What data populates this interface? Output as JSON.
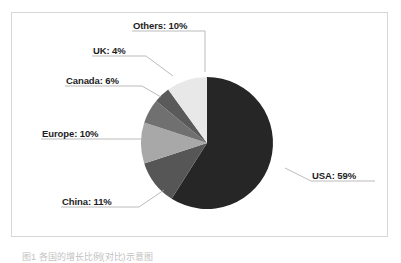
{
  "figure": {
    "background_color": "#ffffff",
    "frame_border_color": "#d6d6d6",
    "caption": "图1  各国的增长比例(对比)示意图"
  },
  "chart_data": {
    "type": "pie",
    "title": "",
    "xlabel": "",
    "ylabel": "",
    "legend_position": "none",
    "grid": false,
    "start_angle_deg": 90,
    "direction": "clockwise",
    "categories": [
      "USA",
      "China",
      "Europe",
      "Canada",
      "UK",
      "Others"
    ],
    "values": [
      59,
      11,
      10,
      6,
      4,
      10
    ],
    "unit": "%",
    "colors": [
      "#262626",
      "#565656",
      "#a8a8a8",
      "#707070",
      "#5a5a5a",
      "#e8e8e8"
    ],
    "labels": [
      {
        "key": "usa",
        "name": "USA",
        "value": 59,
        "text": "USA: 59%"
      },
      {
        "key": "china",
        "name": "China",
        "value": 11,
        "text": "China: 11%"
      },
      {
        "key": "europe",
        "name": "Europe",
        "value": 10,
        "text": "Europe: 10%"
      },
      {
        "key": "canada",
        "name": "Canada",
        "value": 6,
        "text": "Canada: 6%"
      },
      {
        "key": "uk",
        "name": "UK",
        "value": 4,
        "text": "UK: 4%"
      },
      {
        "key": "others",
        "name": "Others",
        "value": 10,
        "text": "Others: 10%"
      }
    ]
  }
}
